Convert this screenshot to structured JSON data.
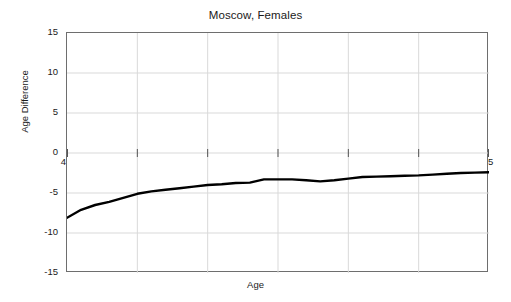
{
  "chart_data": {
    "type": "line",
    "title": "Moscow, Females",
    "xlabel": "Age",
    "ylabel": "Age Difference",
    "xlim": [
      45,
      75
    ],
    "ylim": [
      -15,
      15
    ],
    "xticks": [
      45,
      50,
      55,
      60,
      65,
      70,
      75
    ],
    "yticks": [
      15,
      10,
      5,
      0,
      -5,
      -10,
      -15
    ],
    "xtick_labels": [
      "45",
      "50",
      "55",
      "60",
      "65",
      "70",
      "75"
    ],
    "ytick_labels": [
      "15",
      "10",
      "5",
      "0",
      "-5",
      "-10",
      "-15"
    ],
    "grid": true,
    "legend": null,
    "line_color": "#000000",
    "line_width": 2.4,
    "series": [
      {
        "name": "Age Difference",
        "x": [
          45,
          46,
          47,
          48,
          49,
          50,
          51,
          52,
          53,
          54,
          55,
          56,
          57,
          58,
          59,
          60,
          61,
          62,
          63,
          64,
          65,
          66,
          67,
          68,
          69,
          70,
          71,
          72,
          73,
          74,
          75
        ],
        "values": [
          -8.1,
          -7.1,
          -6.5,
          -6.1,
          -5.6,
          -5.1,
          -4.8,
          -4.6,
          -4.4,
          -4.2,
          -4.0,
          -3.9,
          -3.75,
          -3.7,
          -3.3,
          -3.3,
          -3.3,
          -3.4,
          -3.55,
          -3.4,
          -3.2,
          -3.0,
          -2.95,
          -2.9,
          -2.85,
          -2.8,
          -2.7,
          -2.6,
          -2.5,
          -2.45,
          -2.4
        ]
      }
    ]
  },
  "figure": {
    "background": "#ffffff",
    "axes_color": "#6e6e6e",
    "grid_color": "#d9d9d9"
  }
}
